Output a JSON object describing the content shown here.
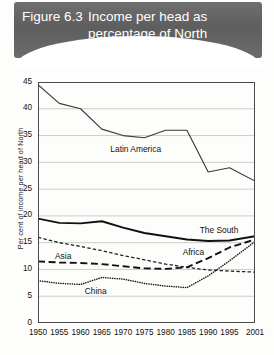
{
  "figure": {
    "number_label": "Figure 6.3",
    "title_line1": "Income per head as",
    "title_line2": "percentage of North",
    "banner_color": "#666666",
    "banner_text_color": "#ffffff"
  },
  "chart_data": {
    "type": "line",
    "title": "Income per head as percentage of North",
    "xlabel": "",
    "ylabel": "Per cent of income per head of North",
    "x": [
      1950,
      1955,
      1960,
      1965,
      1970,
      1975,
      1980,
      1985,
      1990,
      1995,
      2001
    ],
    "xlim": [
      1950,
      2001
    ],
    "ylim": [
      0,
      45
    ],
    "yticks": [
      0,
      5,
      10,
      15,
      20,
      25,
      30,
      35,
      40,
      45
    ],
    "xticks": [
      "1950",
      "1955",
      "1960",
      "1965",
      "1970",
      "1975",
      "1980",
      "1985",
      "1990",
      "1995",
      "2001"
    ],
    "grid": "horizontal",
    "legend": "inline-labels",
    "series": [
      {
        "name": "Latin America",
        "style": "solid-thin",
        "color": "#3b3b3b",
        "values": [
          44.5,
          41.0,
          40.0,
          36.2,
          35.0,
          34.6,
          36.0,
          36.0,
          28.2,
          29.0,
          26.5
        ]
      },
      {
        "name": "The South",
        "style": "solid-thick",
        "color": "#111111",
        "values": [
          19.5,
          18.7,
          18.6,
          19.0,
          17.8,
          16.8,
          16.2,
          15.6,
          15.3,
          15.4,
          16.2
        ]
      },
      {
        "name": "Africa",
        "style": "short-dash",
        "color": "#222222",
        "values": [
          16.0,
          15.0,
          14.3,
          13.5,
          12.6,
          11.8,
          11.0,
          10.4,
          9.9,
          9.7,
          9.5
        ]
      },
      {
        "name": "Asia",
        "style": "long-dash",
        "color": "#111111",
        "values": [
          11.5,
          11.3,
          11.2,
          11.0,
          10.6,
          10.2,
          10.1,
          10.4,
          12.1,
          14.1,
          15.6
        ]
      },
      {
        "name": "China",
        "style": "dotted",
        "color": "#1a1a1a",
        "values": [
          7.9,
          7.4,
          7.2,
          8.5,
          8.2,
          7.4,
          6.9,
          6.6,
          8.8,
          11.6,
          15.2
        ]
      }
    ],
    "annotations": [
      {
        "text": "Latin America",
        "x": 1967,
        "y": 32.4
      },
      {
        "text": "The South",
        "x": 1988,
        "y": 17.4
      },
      {
        "text": "Africa",
        "x": 1984,
        "y": 13.3
      },
      {
        "text": "Asia",
        "x": 1954,
        "y": 12.5
      },
      {
        "text": "China",
        "x": 1961,
        "y": 5.9
      }
    ]
  }
}
